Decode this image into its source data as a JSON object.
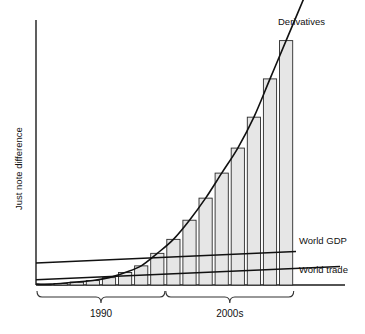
{
  "chart_data": {
    "type": "bar",
    "title": "",
    "xlabel": "",
    "ylabel": "Just note difference",
    "grid": false,
    "legend_position": "inline-right-of-curve",
    "x_axis_ticks": [],
    "y_axis_ticks": [],
    "period_brackets": [
      {
        "label": "1990",
        "bar_start_index": 0,
        "bar_end_index": 7
      },
      {
        "label": "2000s",
        "bar_start_index": 8,
        "bar_end_index": 15
      }
    ],
    "categories": [
      "1",
      "2",
      "3",
      "4",
      "5",
      "6",
      "7",
      "8",
      "9",
      "10",
      "11",
      "12",
      "13",
      "14",
      "15",
      "16"
    ],
    "series": [
      {
        "name": "Derivatives",
        "render": "bars-with-trend-curve",
        "label": "Derivatives",
        "values": [
          1,
          2,
          4,
          6,
          10,
          17,
          26,
          43,
          62,
          88,
          118,
          152,
          186,
          228,
          280,
          332
        ],
        "ylim": [
          0,
          360
        ]
      },
      {
        "name": "World GDP",
        "render": "line",
        "label": "World GDP",
        "values": [
          30,
          31,
          32,
          33,
          34,
          35,
          36,
          37,
          38,
          39,
          40,
          41,
          42,
          43,
          44,
          45
        ],
        "ylim": [
          0,
          360
        ]
      },
      {
        "name": "World trade",
        "render": "line",
        "label": "World trade",
        "values": [
          7,
          8,
          9,
          10,
          11,
          12,
          13,
          14,
          15,
          16,
          17,
          18,
          19,
          20,
          21,
          22
        ],
        "ylim": [
          0,
          360
        ]
      }
    ]
  },
  "labels": {
    "y_axis": "Just note difference",
    "derivatives": "Derivatives",
    "world_gdp": "World GDP",
    "world_trade": "World trade",
    "period_1": "1990",
    "period_2": "2000s"
  },
  "colors": {
    "bar_fill": "#e6e6e6",
    "bar_stroke": "#2b2b2b",
    "line": "#111111",
    "axis": "#1a1a1a",
    "background": "#ffffff"
  }
}
